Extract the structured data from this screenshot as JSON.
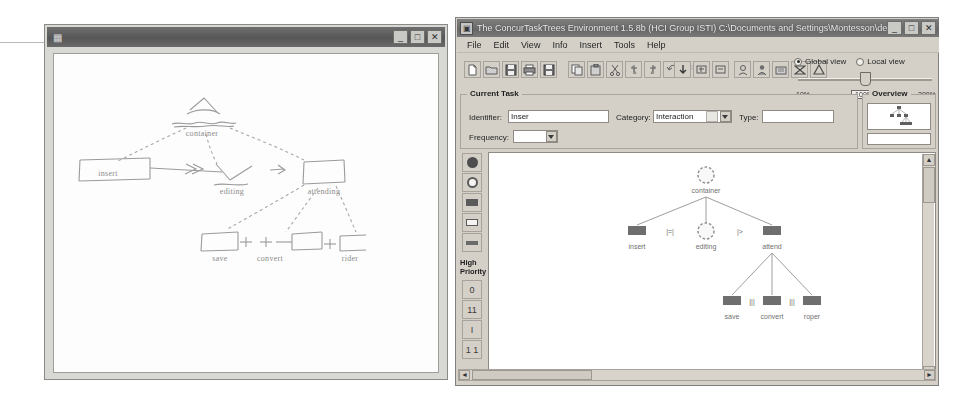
{
  "sketch_window": {
    "title": "",
    "title_icon": "app-icon",
    "buttons": {
      "minimize": "_",
      "maximize": "□",
      "close": "✕"
    },
    "sketch": {
      "description": "hand-drawn task tree sketch",
      "nodes": [
        {
          "id": "root",
          "label": "container",
          "x": 148,
          "y": 78
        },
        {
          "id": "insert",
          "label": "insert",
          "x": 52,
          "y": 128
        },
        {
          "id": "editing",
          "label": "editing",
          "x": 148,
          "y": 132
        },
        {
          "id": "attend",
          "label": "attending",
          "x": 248,
          "y": 132
        },
        {
          "id": "save",
          "label": "save",
          "x": 152,
          "y": 196
        },
        {
          "id": "convert",
          "label": "convert",
          "x": 212,
          "y": 196
        },
        {
          "id": "rider",
          "label": "rider",
          "x": 268,
          "y": 196
        }
      ],
      "operators": [
        "»",
        ">>",
        "|=|"
      ]
    }
  },
  "ctt_window": {
    "title": "The ConcurTaskTrees Environment 1.5.8b (HCI Group ISTI) C:\\Documents and Settings\\Montesson\\desin...",
    "title_icon": "ctt-app-icon",
    "buttons": {
      "minimize": "_",
      "maximize": "□",
      "close": "✕"
    },
    "menu": [
      "File",
      "Edit",
      "View",
      "Info",
      "Insert",
      "Tools",
      "Help"
    ],
    "toolbar": {
      "group1": [
        {
          "icon": "new-document-icon"
        },
        {
          "icon": "open-folder-icon"
        },
        {
          "icon": "save-icon"
        },
        {
          "icon": "print-icon"
        },
        {
          "icon": "save-as-icon"
        }
      ],
      "group2": [
        {
          "icon": "copy-icon"
        },
        {
          "icon": "paste-icon"
        },
        {
          "icon": "cut-icon"
        },
        {
          "icon": "delete-icon"
        },
        {
          "icon": "insert-icon"
        },
        {
          "icon": "undo-icon"
        },
        {
          "icon": "redo-icon"
        }
      ],
      "group3": [
        {
          "icon": "arrow-down-icon"
        },
        {
          "icon": "expand-icon"
        },
        {
          "icon": "collapse-icon"
        }
      ],
      "group4": [
        {
          "icon": "abstract-task-icon"
        },
        {
          "icon": "user-task-icon"
        },
        {
          "icon": "application-task-icon"
        },
        {
          "icon": "interaction-task-icon"
        },
        {
          "icon": "cooperative-task-icon"
        }
      ]
    },
    "view_modes": [
      {
        "label": "Global view",
        "selected": true
      },
      {
        "label": "Local view",
        "selected": false
      }
    ],
    "zoom": {
      "min_label": "10%",
      "current_label": "100%",
      "max_label": "200%",
      "value": 100
    },
    "current_task": {
      "legend": "Current Task",
      "identifier_label": "Identifier:",
      "identifier_value": "Inser",
      "category_label": "Category:",
      "category_value": "Interaction",
      "category_icon": "interaction-task-icon",
      "type_label": "Type:",
      "type_value": "",
      "frequency_label": "Frequency:",
      "frequency_value": ""
    },
    "overview": {
      "legend": "Overview",
      "thumbnail": "task-tree-thumbnail"
    },
    "palette": {
      "tools": [
        {
          "icon": "filled-circle-icon"
        },
        {
          "icon": "open-circle-icon"
        },
        {
          "icon": "filled-rect-icon"
        },
        {
          "icon": "open-rect-icon"
        }
      ],
      "priority_label_line1": "High",
      "priority_label_line2": "Priority",
      "priority_tools": [
        {
          "icon": "priority-1-icon",
          "glyph": "0"
        },
        {
          "icon": "priority-2-icon",
          "glyph": "11"
        },
        {
          "icon": "priority-3-icon",
          "glyph": "I"
        },
        {
          "icon": "priority-4-icon",
          "glyph": "1 1"
        }
      ]
    },
    "diagram": {
      "title": "task tree",
      "nodes": [
        {
          "id": "root",
          "label": "container",
          "shape": "circle",
          "x": 217,
          "y": 22
        },
        {
          "id": "insert",
          "label": "insert",
          "shape": "rect",
          "x": 148,
          "y": 82
        },
        {
          "id": "editing",
          "label": "editing",
          "shape": "circle",
          "x": 217,
          "y": 82
        },
        {
          "id": "attend",
          "label": "attend",
          "shape": "rect",
          "x": 283,
          "y": 82
        },
        {
          "id": "save",
          "label": "save",
          "shape": "rect",
          "x": 243,
          "y": 152
        },
        {
          "id": "convert",
          "label": "convert",
          "shape": "rect",
          "x": 283,
          "y": 152
        },
        {
          "id": "roper",
          "label": "roper",
          "shape": "rect",
          "x": 323,
          "y": 152
        }
      ],
      "operators": [
        {
          "symbol": "|=|",
          "x": 181,
          "y": 85
        },
        {
          "symbol": "|>",
          "x": 251,
          "y": 85
        },
        {
          "symbol": "|||",
          "x": 263,
          "y": 155
        },
        {
          "symbol": "|||",
          "x": 303,
          "y": 155
        }
      ]
    },
    "scrollbars": {
      "vertical": {
        "up": "▲",
        "down": "▼"
      },
      "horizontal": {
        "left": "◄",
        "right": "►"
      }
    }
  }
}
